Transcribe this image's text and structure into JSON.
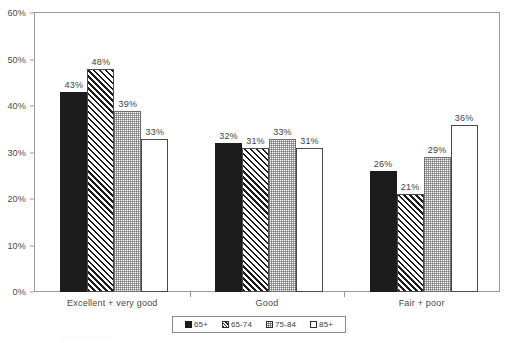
{
  "chart_data": {
    "type": "bar",
    "title": "",
    "subtitle": "",
    "xlabel": "",
    "ylabel": "",
    "ylim": [
      0,
      60
    ],
    "y_tick_labels": [
      "0%",
      "10%",
      "20%",
      "30%",
      "40%",
      "50%",
      "60%"
    ],
    "y_tick_values": [
      0,
      10,
      20,
      30,
      40,
      50,
      60
    ],
    "grid": false,
    "legend_position": "bottom",
    "categories": [
      "Excellent + very good",
      "Good",
      "Fair + poor"
    ],
    "series": [
      {
        "name": "65+",
        "values": [
          43,
          32,
          26
        ],
        "labels": [
          "43%",
          "32%",
          "26%"
        ],
        "pattern": "solid-black"
      },
      {
        "name": "65-74",
        "values": [
          48,
          31,
          21
        ],
        "labels": [
          "48%",
          "31%",
          "21%"
        ],
        "pattern": "diagonal-hatch"
      },
      {
        "name": "75-84",
        "values": [
          39,
          33,
          29
        ],
        "labels": [
          "39%",
          "33%",
          "29%"
        ],
        "pattern": "dotted-light"
      },
      {
        "name": "85+",
        "values": [
          33,
          31,
          36
        ],
        "labels": [
          "33%",
          "31%",
          "36%"
        ],
        "pattern": "white-empty"
      }
    ]
  },
  "legend": {
    "items": [
      {
        "label": "65+"
      },
      {
        "label": "65-74"
      },
      {
        "label": "75-84"
      },
      {
        "label": "85+"
      }
    ]
  },
  "colors": {
    "series_0": "#1c1c1c",
    "series_1": "#1c1c1c",
    "series_2": "#6e6e6e",
    "series_3": "#ffffff",
    "axis": "#9b9b9b",
    "text": "#3f3f3f",
    "background": "#ffffff"
  }
}
